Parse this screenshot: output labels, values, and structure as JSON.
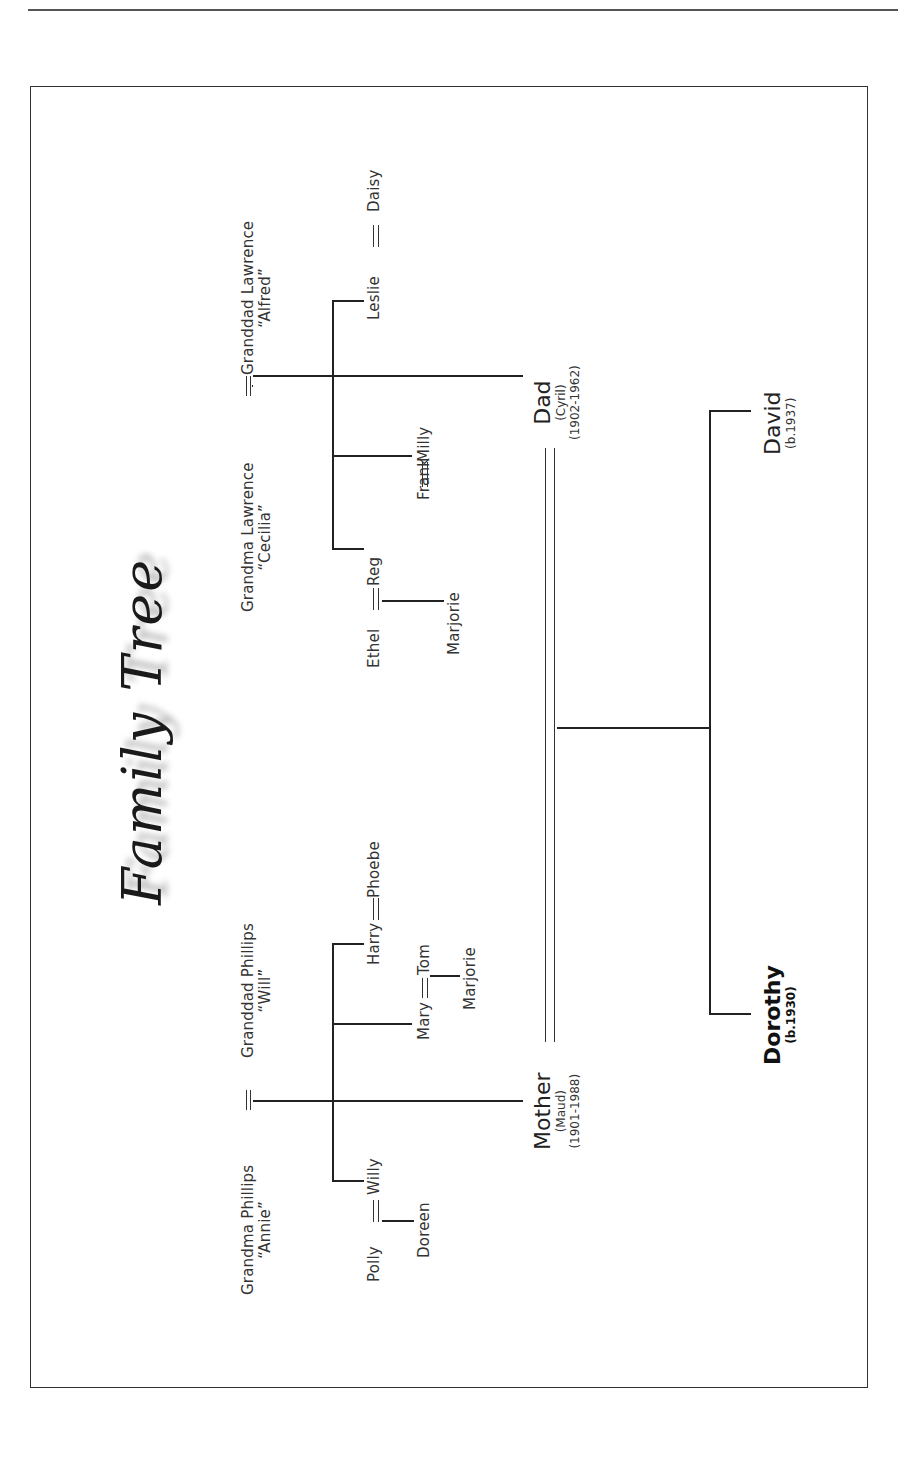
{
  "page": {
    "title": "Family Tree"
  },
  "paternal": {
    "grandma": {
      "name": "Grandma Lawrence",
      "nickname": "“Cecilia”"
    },
    "granddad": {
      "name": "Granddad Lawrence",
      "nickname": "“Alfred”"
    },
    "children": [
      {
        "name": "Leslie",
        "spouse": "Daisy"
      },
      {
        "name": "Frank",
        "spouse": "Milly"
      },
      {
        "name": "Reg",
        "spouse": "Ethel",
        "child": "Marjorie"
      }
    ]
  },
  "maternal": {
    "grandma": {
      "name": "Grandma Phillips",
      "nickname": "“Annie”"
    },
    "granddad": {
      "name": "Granddad Phillips",
      "nickname": "“Will”"
    },
    "children": [
      {
        "name": "Harry",
        "spouse": "Phoebe"
      },
      {
        "name": "Mary",
        "spouse": "Tom",
        "child": "Marjorie"
      },
      {
        "name": "Willy",
        "spouse": "Polly",
        "child": "Doreen"
      }
    ]
  },
  "parents": {
    "dad": {
      "label": "Dad",
      "name": "(Cyril)",
      "dates": "(1902-1962)"
    },
    "mother": {
      "label": "Mother",
      "name": "(Maud)",
      "dates": "(1901-1988)"
    }
  },
  "children": {
    "david": {
      "name": "David",
      "dates": "(b.1937)"
    },
    "dorothy": {
      "name": "Dorothy",
      "dates": "(b.1930)"
    }
  }
}
